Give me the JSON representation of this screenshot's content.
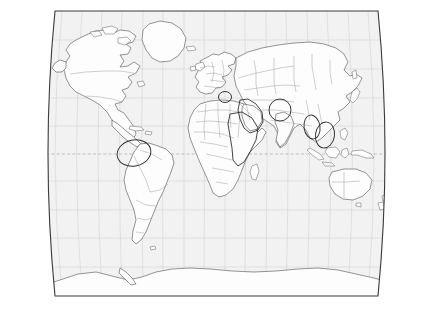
{
  "figure": {
    "kind": "world-map",
    "title": "",
    "projection": "Robinson / Winkel Tripel pseudocylindrical",
    "background_color": "#ffffff",
    "ocean_color": "#f2f2f2",
    "land_color": "#fdfdfd",
    "coastline_color": "#555555",
    "country_border_color": "#8d8d8d",
    "graticule_color": "#c9c9c9",
    "frame_color": "#3a3a3a",
    "annotation_color": "#2e2e2e",
    "width_px": 431,
    "height_px": 313
  },
  "map_data": {
    "type": "outline-map",
    "has_country_borders": true,
    "has_graticule": true,
    "graticule_meridian_step_deg": 15,
    "graticule_parallel_step_deg": 15,
    "equator_style": "dashed",
    "labels_visible": false,
    "legend_visible": false,
    "frame": {
      "top_left": [
        55,
        11
      ],
      "top_right": [
        378,
        11
      ],
      "bottom_right": [
        378,
        296
      ],
      "bottom_left": [
        55,
        296
      ],
      "side_curvature": "convex-outward"
    },
    "continents": [
      "North America",
      "South America",
      "Greenland",
      "Europe",
      "Africa",
      "Asia",
      "Australia",
      "Antarctica"
    ],
    "annotations": [
      {
        "name": "northern-south-america",
        "shape": "ellipse",
        "cx": 134,
        "cy": 153,
        "rx": 17,
        "ry": 13,
        "rotation": -12
      },
      {
        "name": "balkans",
        "shape": "ellipse",
        "cx": 225,
        "cy": 97,
        "rx": 6.5,
        "ry": 5.5,
        "rotation": 0
      },
      {
        "name": "levant-arabia",
        "shape": "region",
        "cx": 248,
        "cy": 115,
        "rx": 13,
        "ry": 20,
        "rotation": 10
      },
      {
        "name": "afghanistan-pakistan",
        "shape": "ellipse",
        "cx": 280,
        "cy": 110,
        "rx": 11,
        "ry": 11,
        "rotation": 0
      },
      {
        "name": "myanmar-thailand",
        "shape": "ellipse",
        "cx": 312,
        "cy": 127,
        "rx": 8,
        "ry": 12,
        "rotation": -8
      },
      {
        "name": "indochina-south-china-sea",
        "shape": "ellipse",
        "cx": 325,
        "cy": 135,
        "rx": 9.5,
        "ry": 13,
        "rotation": 8
      },
      {
        "name": "horn-of-africa-sudan",
        "shape": "region",
        "cx": 243,
        "cy": 140,
        "rx": 16,
        "ry": 26,
        "rotation": 0
      }
    ]
  }
}
